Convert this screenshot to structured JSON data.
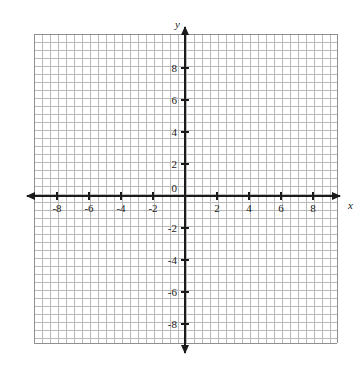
{
  "chart_data": {
    "type": "scatter",
    "title": "",
    "subtitle": "",
    "xlabel": "x",
    "ylabel": "y",
    "xlim": [
      -9.5,
      9.5
    ],
    "ylim": [
      -10,
      10
    ],
    "grid": true,
    "grid_step": 1,
    "legend": null,
    "series": [],
    "x_tick_labels": [
      "-8",
      "-6",
      "-4",
      "-2",
      "2",
      "4",
      "6",
      "8"
    ],
    "x_tick_values": [
      -8,
      -6,
      -4,
      -2,
      2,
      4,
      6,
      8
    ],
    "y_tick_labels": [
      "8",
      "6",
      "4",
      "2",
      "-2",
      "-4",
      "-6",
      "-8"
    ],
    "y_tick_values": [
      8,
      6,
      4,
      2,
      -2,
      -4,
      -6,
      -8
    ],
    "origin_label": "0",
    "annotations": []
  },
  "plot": {
    "origin_label": "0",
    "x_axis_name": "x",
    "y_axis_name": "y",
    "x_labels": [
      {
        "text": "-8",
        "value": -8
      },
      {
        "text": "-6",
        "value": -6
      },
      {
        "text": "-4",
        "value": -4
      },
      {
        "text": "-2",
        "value": -2
      },
      {
        "text": "2",
        "value": 2
      },
      {
        "text": "4",
        "value": 4
      },
      {
        "text": "6",
        "value": 6
      },
      {
        "text": "8",
        "value": 8
      }
    ],
    "y_labels": [
      {
        "text": "8",
        "value": 8
      },
      {
        "text": "6",
        "value": 6
      },
      {
        "text": "4",
        "value": 4
      },
      {
        "text": "2",
        "value": 2
      },
      {
        "text": "-2",
        "value": -2
      },
      {
        "text": "-4",
        "value": -4
      },
      {
        "text": "-6",
        "value": -6
      },
      {
        "text": "-8",
        "value": -8
      }
    ],
    "colors": {
      "grid_minor": "#b9b9b9",
      "grid_major": "#8f8f8f",
      "axis": "#1a1a1a",
      "background": "#ffffff",
      "text": "#1a1a1a"
    },
    "geometry": {
      "origin_x": 185,
      "origin_y": 196,
      "cell": 16,
      "grid_left": 34,
      "grid_right": 337,
      "grid_top": 34,
      "grid_bottom": 343,
      "x_arrow_left": 21,
      "x_arrow_right": 346,
      "y_arrow_top": 21,
      "y_arrow_bottom": 359
    }
  }
}
